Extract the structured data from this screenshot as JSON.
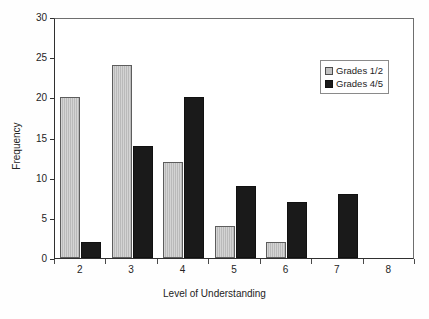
{
  "chart_data": {
    "type": "bar",
    "title": "",
    "subtitle": "",
    "xlabel": "Level of Understanding",
    "ylabel": "Frequency",
    "categories": [
      "2",
      "3",
      "4",
      "5",
      "6",
      "7",
      "8"
    ],
    "series": [
      {
        "name": "Grades 1/2",
        "color": "#c2c2c2",
        "values": [
          20,
          24,
          12,
          4,
          2,
          0,
          0
        ]
      },
      {
        "name": "Grades 4/5",
        "color": "#1a1a1a",
        "values": [
          2,
          14,
          20,
          9,
          7,
          8,
          0
        ]
      }
    ],
    "ylim": [
      0,
      30
    ],
    "yticks": [
      0,
      5,
      10,
      15,
      20,
      25,
      30
    ],
    "ytick_labels": [
      "0",
      "5",
      "10",
      "15",
      "20",
      "25",
      "30"
    ],
    "grid": false,
    "legend_position": "upper right",
    "legend_border": true,
    "annotations": []
  },
  "figure": {
    "background": "#fefefe",
    "plot_background": "#ffffff",
    "axis_color": "#303030"
  }
}
